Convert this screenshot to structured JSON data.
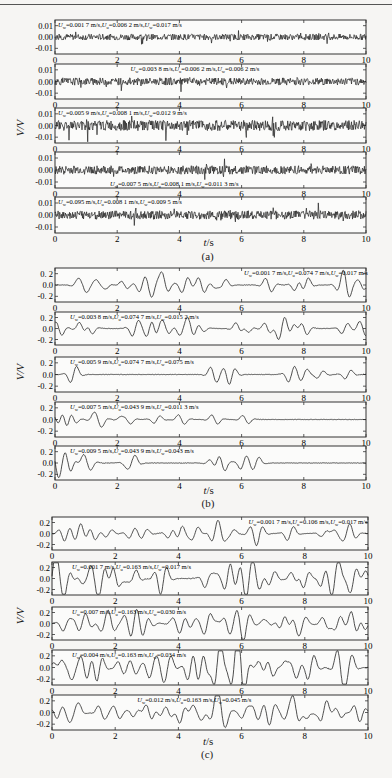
{
  "figure": {
    "ylabel": "V/V",
    "xlabel": "t/s",
    "captions": [
      "(a)",
      "(b)",
      "(c)"
    ]
  },
  "chart_data": [
    {
      "type": "line",
      "title": "(a)",
      "xlabel": "t/s",
      "ylabel": "V/V",
      "xlim": [
        0,
        10
      ],
      "ylim": [
        -0.015,
        0.015
      ],
      "xticks": [
        "0",
        "2",
        "4",
        "6",
        "8",
        "10"
      ],
      "yticks": [
        "0.01",
        "0.00",
        "-0.01"
      ],
      "grid": false,
      "series": [
        {
          "name": "U_w=0.001 7 m/s,U_u=0.006 2 m/s,U_w=0.017 m/s",
          "label_pos": "top-left",
          "amplitude": 0.006,
          "style": "noise"
        },
        {
          "name": "U_w=0.003 8 m/s,U_u=0.006 2 m/s,U_w=0.006 2 m/s",
          "label_pos": "top-center",
          "amplitude": 0.007,
          "style": "noise"
        },
        {
          "name": "U_w=0.005 9 m/s,U_u=0.008 1 m/s,U_w=0.012 9 m/s",
          "label_pos": "top-left",
          "amplitude": 0.01,
          "style": "noise"
        },
        {
          "name": "U_w=0.007 5 m/s,U_u=0.008 1 m/s,U_w=0.011 3 m/s",
          "label_pos": "bottom-left",
          "amplitude": 0.008,
          "style": "noise"
        },
        {
          "name": "U_w=0.095 m/s,U_u=0.008 1 m/s,U_w=0.009 5 m/s",
          "label_pos": "top-left",
          "amplitude": 0.008,
          "style": "noise"
        }
      ]
    },
    {
      "type": "line",
      "title": "(b)",
      "xlabel": "t/s",
      "ylabel": "V/V",
      "xlim": [
        0,
        10
      ],
      "ylim": [
        -0.3,
        0.3
      ],
      "xticks": [
        "0",
        "2",
        "4",
        "6",
        "8",
        "10"
      ],
      "yticks": [
        "0. 2",
        "0.0",
        "-0. 2"
      ],
      "grid": false,
      "series": [
        {
          "name": "U_w=0.001 7 m/s,U_u=0.074 7 m/s,U_w=0.017 m/s",
          "label_pos": "top-right",
          "amplitude": 0.15,
          "style": "pulses"
        },
        {
          "name": "U_w=0.003 8 m/s,U_u=0.074 7 m/s,U_w=0.015 2 m/s",
          "label_pos": "top-left",
          "amplitude": 0.15,
          "style": "pulses"
        },
        {
          "name": "U_w=0.005 9 m/s,U_u=0.074 7 m/s,U_w=0.075 m/s",
          "label_pos": "top-left",
          "amplitude": 0.15,
          "style": "sparse"
        },
        {
          "name": "U_w=0.007 5 m/s,U_u=0.043 9 m/s,U_w=0.011 3 m/s",
          "label_pos": "top-left",
          "amplitude": 0.12,
          "style": "decay"
        },
        {
          "name": "U_w=0.009 5 m/s,U_u=0.043 9 m/s,U_w=0.043 m/s",
          "label_pos": "top-left",
          "amplitude": 0.15,
          "style": "decay"
        }
      ]
    },
    {
      "type": "line",
      "title": "(c)",
      "xlabel": "t/s",
      "ylabel": "V/V",
      "xlim": [
        0,
        10
      ],
      "ylim": [
        -0.3,
        0.3
      ],
      "xticks": [
        "0",
        "2",
        "4",
        "6",
        "8",
        "10"
      ],
      "yticks": [
        "0.2",
        "0.0",
        "-0.2"
      ],
      "grid": false,
      "series": [
        {
          "name": "U_w=0.001 7 m/s,U_u=0.106 m/s,U_w=0.017 m/s",
          "label_pos": "top-right",
          "amplitude": 0.14,
          "style": "pulses"
        },
        {
          "name": "U_w=0.001 7 m/s,U_u=0.163 m/s,U_w=0.017 m/s",
          "label_pos": "top-left",
          "amplitude": 0.22,
          "style": "dense"
        },
        {
          "name": "U_w=0.007 m/s,U_u=0.163 m/s,U_w=0.030 m/s",
          "label_pos": "top-left",
          "amplitude": 0.16,
          "style": "dense"
        },
        {
          "name": "U_w=0.004 m/s,U_u=0.163 m/s,U_w=0.034 m/s",
          "label_pos": "top-left",
          "amplitude": 0.25,
          "style": "dense"
        },
        {
          "name": "U_w=0.012 m/s,U_u=0.163 m/s,U_w=0.045 m/s",
          "label_pos": "top-center",
          "amplitude": 0.18,
          "style": "dense"
        }
      ]
    }
  ],
  "layout": {
    "groups": [
      {
        "left": 55,
        "right": 366,
        "boxes": [
          [
            20,
            54
          ],
          [
            64,
            99
          ],
          [
            108,
            143
          ],
          [
            152,
            188
          ],
          [
            197,
            233
          ]
        ],
        "xlab_y": 244,
        "cap_y": 256,
        "ylab_y": 128
      },
      {
        "left": 55,
        "right": 366,
        "boxes": [
          [
            268,
            302
          ],
          [
            312,
            345
          ],
          [
            357,
            392
          ],
          [
            402,
            437
          ],
          [
            446,
            480
          ]
        ],
        "xlab_y": 492,
        "cap_y": 503,
        "ylab_y": 372
      },
      {
        "left": 52,
        "right": 368,
        "boxes": [
          [
            517,
            550
          ],
          [
            562,
            595
          ],
          [
            607,
            640
          ],
          [
            650,
            685
          ],
          [
            695,
            730
          ]
        ],
        "xlab_y": 743,
        "cap_y": 754,
        "ylab_y": 616
      }
    ]
  }
}
